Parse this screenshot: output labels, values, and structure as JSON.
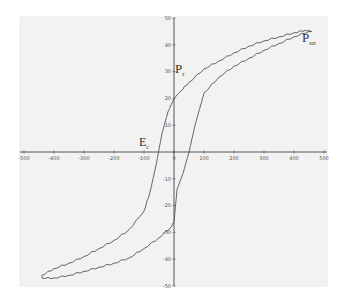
{
  "chart_data": {
    "type": "line",
    "title": "",
    "xlabel": "",
    "ylabel": "",
    "xlim": [
      -500,
      500
    ],
    "ylim": [
      -50,
      50
    ],
    "grid": false,
    "legend": null,
    "x_ticks": [
      -500,
      -400,
      -300,
      -200,
      -100,
      0,
      100,
      200,
      300,
      400,
      500
    ],
    "y_ticks": [
      50,
      40,
      30,
      20,
      10,
      -10,
      -20,
      -30,
      -40,
      -50
    ],
    "x_tick_labels": [
      "-500",
      "-400",
      "-300",
      "-200",
      "-100",
      "0",
      "100",
      "200",
      "300",
      "400",
      "500"
    ],
    "y_tick_labels": [
      "50",
      "40",
      "30",
      "20",
      "10",
      "-10",
      "-20",
      "-30",
      "-40",
      "-50"
    ],
    "series": [
      {
        "name": "Descending branch",
        "x": [
          460,
          440,
          400,
          350,
          300,
          250,
          200,
          150,
          100,
          50,
          20,
          0,
          -20,
          -40,
          -60,
          -80,
          -100,
          -150,
          -200,
          -250,
          -300,
          -350,
          -400,
          -440
        ],
        "y": [
          45,
          45.5,
          44.5,
          43,
          41.5,
          39.5,
          37,
          34,
          31,
          26,
          22.5,
          20,
          15,
          7,
          -5,
          -15,
          -22,
          -29,
          -33,
          -36,
          -39,
          -41.5,
          -43.5,
          -46
        ]
      },
      {
        "name": "Ascending branch",
        "x": [
          -440,
          -400,
          -350,
          -300,
          -250,
          -200,
          -150,
          -100,
          -50,
          -10,
          0,
          10,
          30,
          50,
          70,
          90,
          100,
          150,
          200,
          250,
          300,
          350,
          400,
          450
        ],
        "y": [
          -47,
          -47,
          -46,
          -44.5,
          -43,
          -41.5,
          -39.5,
          -36,
          -32,
          -28,
          -26,
          -14,
          -8,
          0,
          10,
          18,
          22,
          28,
          32,
          35,
          38,
          40.5,
          43,
          45
        ]
      }
    ],
    "annotations": [
      {
        "text": "P",
        "sub": "r",
        "x": 10,
        "y": 30
      },
      {
        "text": "P",
        "sub": "sat",
        "x": 460,
        "y": 43
      },
      {
        "text": "E",
        "sub": "c",
        "x": -60,
        "y": 3
      }
    ]
  },
  "labels": {
    "pr_main": "P",
    "pr_sub": "r",
    "psat_main": "P",
    "psat_sub": "sat",
    "ec_main": "E",
    "ec_sub": "c"
  },
  "colors": {
    "plot_bg": "#f2f2f2",
    "curve": "#555555",
    "axis": "#444444"
  }
}
